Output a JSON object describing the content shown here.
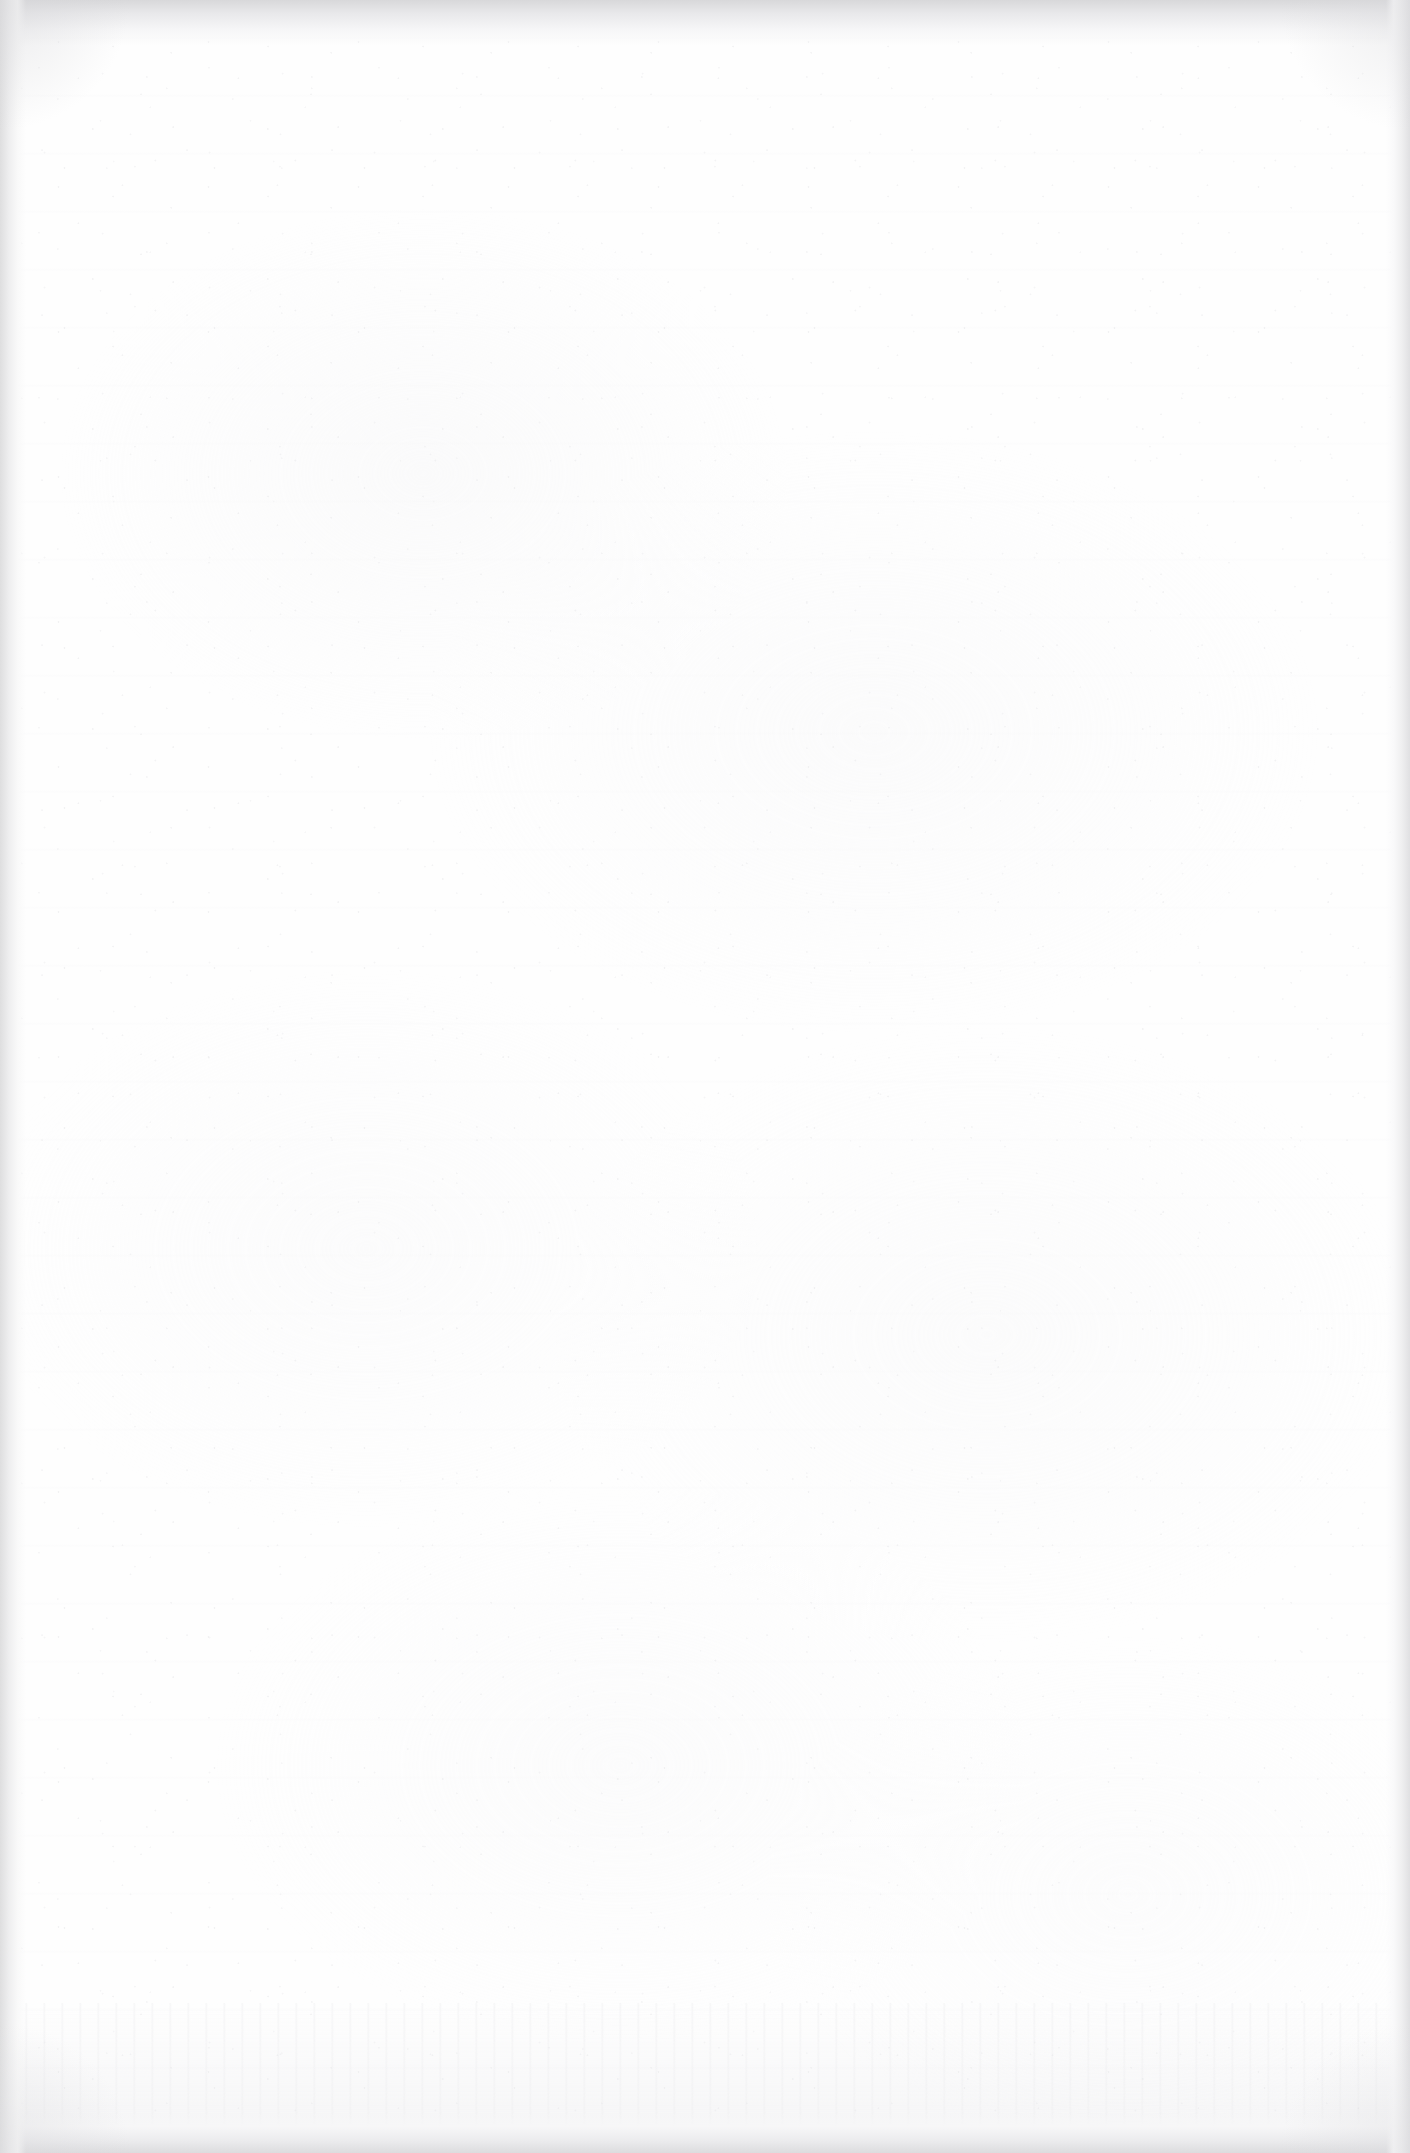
{
  "page": {
    "kind": "blank-scanned-page",
    "width_px": 1410,
    "height_px": 2153,
    "visible_text": "",
    "content_elements": []
  },
  "appearance": {
    "paper_color": "#fefefe",
    "paper_mottle_color": "#f7f7f8",
    "grain_color": "#e9e9eb",
    "ghost_streak_color": "#f6f6f7",
    "bottom_band_color": "#e7e7ea"
  },
  "edges": {
    "top_band_color": "#d8d8da",
    "bottom_band_color": "#dcdcde",
    "left_band_color": "#dedede",
    "right_band_color": "#e0e0e2",
    "corner_vignette_color": "#d6d6d9"
  }
}
